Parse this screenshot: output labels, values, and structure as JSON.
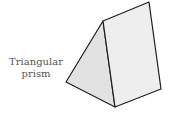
{
  "diagram": {
    "label_line1": "Triangular",
    "label_line2": "prism",
    "colors": {
      "left_face": "#e2e2e2",
      "right_face": "#eeeeee",
      "edge": "#1e1e1e",
      "label_text": "#555555"
    },
    "vertices": {
      "top_front": [
        103,
        21
      ],
      "top_back": [
        149,
        2
      ],
      "right_bottom": [
        161,
        89
      ],
      "bottom_front": [
        115,
        107
      ],
      "left": [
        66,
        82
      ]
    }
  }
}
